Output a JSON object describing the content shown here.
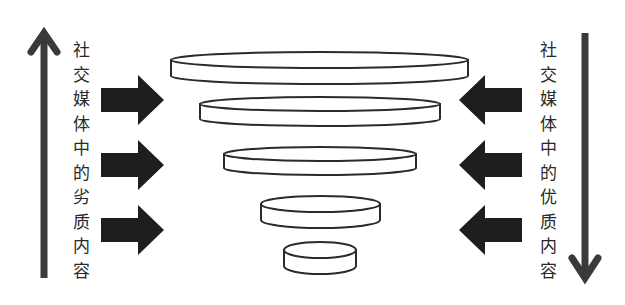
{
  "diagram": {
    "type": "funnel",
    "colors": {
      "arrow": "#3a3a3a",
      "block_arrow": "#1e1e1e",
      "disc_stroke": "#2a2a2a",
      "disc_fill": "#ffffff",
      "text": "#2a2a2a"
    },
    "left": {
      "label": "社交媒体中的劣质内容",
      "chars": [
        "社",
        "交",
        "媒",
        "体",
        "中",
        "的",
        "劣",
        "质",
        "内",
        "容"
      ],
      "direction": "up",
      "inflow_arrows": 3
    },
    "right": {
      "label": "社交媒体中的优质内容",
      "chars": [
        "社",
        "交",
        "媒",
        "体",
        "中",
        "的",
        "优",
        "质",
        "内",
        "容"
      ],
      "direction": "down",
      "inflow_arrows": 3
    },
    "discs": [
      {
        "cx": 319.5,
        "rx": 148.5,
        "top": 60,
        "ry": 8,
        "h": 16
      },
      {
        "cx": 320,
        "rx": 120,
        "top": 104,
        "ry": 7,
        "h": 15
      },
      {
        "cx": 320,
        "rx": 96,
        "top": 154,
        "ry": 7,
        "h": 14
      },
      {
        "cx": 320.5,
        "rx": 59.5,
        "top": 204,
        "ry": 8,
        "h": 16
      },
      {
        "cx": 320,
        "rx": 36,
        "top": 250,
        "ry": 8,
        "h": 16
      }
    ],
    "arrow_rows_y": [
      100,
      165,
      230
    ]
  }
}
